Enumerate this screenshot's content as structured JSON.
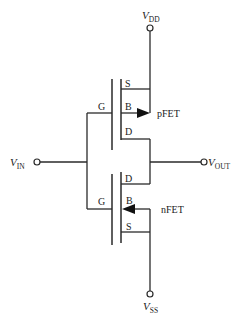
{
  "diagram": {
    "terminals": {
      "vdd": {
        "main": "V",
        "sub": "DD"
      },
      "vss": {
        "main": "V",
        "sub": "SS"
      },
      "vin": {
        "main": "V",
        "sub": "IN"
      },
      "vout": {
        "main": "V",
        "sub": "OUT"
      }
    },
    "pfet": {
      "name": "pFET",
      "gate": "G",
      "source": "S",
      "body": "B",
      "drain": "D"
    },
    "nfet": {
      "name": "nFET",
      "gate": "G",
      "source": "S",
      "body": "B",
      "drain": "D"
    },
    "colors": {
      "line": "#2a2a2a",
      "background": "#ffffff"
    }
  }
}
